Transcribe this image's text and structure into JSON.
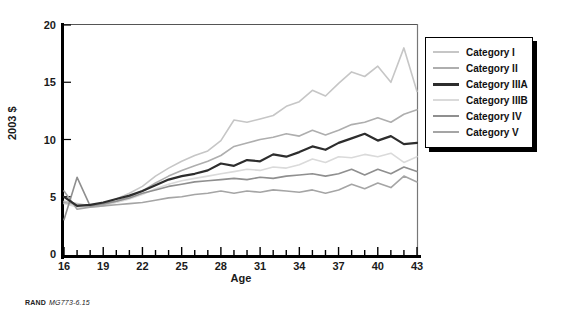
{
  "figure": {
    "source_label": "RAND",
    "source_id": "MG773-6.15"
  },
  "chart_data": {
    "type": "line",
    "title": "",
    "xlabel": "Age",
    "ylabel": "2003 $",
    "xlim": [
      16,
      43
    ],
    "ylim": [
      0,
      20
    ],
    "x_major_ticks": [
      16,
      19,
      22,
      25,
      28,
      31,
      34,
      37,
      40,
      43
    ],
    "x_minor_tick_step": 1,
    "y_ticks": [
      0,
      5,
      10,
      15,
      20
    ],
    "grid": false,
    "legend_position": "upper-right-outside",
    "x": [
      16,
      17,
      18,
      19,
      20,
      21,
      22,
      23,
      24,
      25,
      26,
      27,
      28,
      29,
      30,
      31,
      32,
      33,
      34,
      35,
      36,
      37,
      38,
      39,
      40,
      41,
      42,
      43
    ],
    "series": [
      {
        "name": "Category I",
        "color": "#c6c6c6",
        "stroke_width": 1.6,
        "values": [
          4.6,
          4.4,
          4.2,
          4.4,
          4.8,
          5.3,
          5.9,
          6.8,
          7.5,
          8.1,
          8.6,
          9.0,
          9.9,
          11.7,
          11.5,
          11.8,
          12.1,
          12.9,
          13.3,
          14.3,
          13.8,
          14.9,
          15.9,
          15.5,
          16.4,
          15.0,
          18.0,
          14.2
        ]
      },
      {
        "name": "Category II",
        "color": "#aeaeae",
        "stroke_width": 1.6,
        "values": [
          4.5,
          4.3,
          4.2,
          4.3,
          4.6,
          5.0,
          5.5,
          6.2,
          6.8,
          7.3,
          7.7,
          8.1,
          8.6,
          9.4,
          9.7,
          10.0,
          10.2,
          10.5,
          10.3,
          10.8,
          10.4,
          10.8,
          11.3,
          11.5,
          11.9,
          11.5,
          12.2,
          12.6
        ]
      },
      {
        "name": "Category IIIA",
        "color": "#2d2d2d",
        "stroke_width": 2.2,
        "values": [
          5.0,
          4.2,
          4.3,
          4.5,
          4.8,
          5.1,
          5.5,
          6.0,
          6.5,
          6.8,
          7.0,
          7.3,
          7.9,
          7.7,
          8.2,
          8.1,
          8.7,
          8.5,
          8.9,
          9.4,
          9.1,
          9.7,
          10.1,
          10.5,
          9.9,
          10.3,
          9.6,
          9.7
        ]
      },
      {
        "name": "Category IIIB",
        "color": "#dadada",
        "stroke_width": 1.6,
        "values": [
          4.4,
          4.1,
          4.1,
          4.2,
          4.5,
          4.8,
          5.2,
          5.7,
          6.1,
          6.4,
          6.6,
          6.8,
          7.0,
          7.2,
          7.4,
          7.3,
          7.6,
          7.5,
          7.8,
          8.3,
          8.0,
          8.5,
          8.4,
          8.7,
          8.5,
          8.8,
          8.0,
          8.5
        ]
      },
      {
        "name": "Category IV",
        "color": "#8f8f8f",
        "stroke_width": 1.6,
        "values": [
          3.0,
          6.7,
          4.2,
          4.4,
          4.6,
          4.9,
          5.3,
          5.6,
          5.9,
          6.1,
          6.3,
          6.4,
          6.5,
          6.6,
          6.5,
          6.7,
          6.6,
          6.8,
          6.9,
          7.0,
          6.8,
          7.0,
          7.4,
          6.9,
          7.4,
          7.0,
          7.6,
          7.2
        ]
      },
      {
        "name": "Category V",
        "color": "#a5a5a5",
        "stroke_width": 1.6,
        "values": [
          5.5,
          3.9,
          4.1,
          4.2,
          4.3,
          4.4,
          4.5,
          4.7,
          4.9,
          5.0,
          5.2,
          5.3,
          5.5,
          5.3,
          5.5,
          5.4,
          5.6,
          5.5,
          5.4,
          5.6,
          5.3,
          5.6,
          6.1,
          5.7,
          6.2,
          5.8,
          6.8,
          6.3
        ]
      }
    ]
  }
}
